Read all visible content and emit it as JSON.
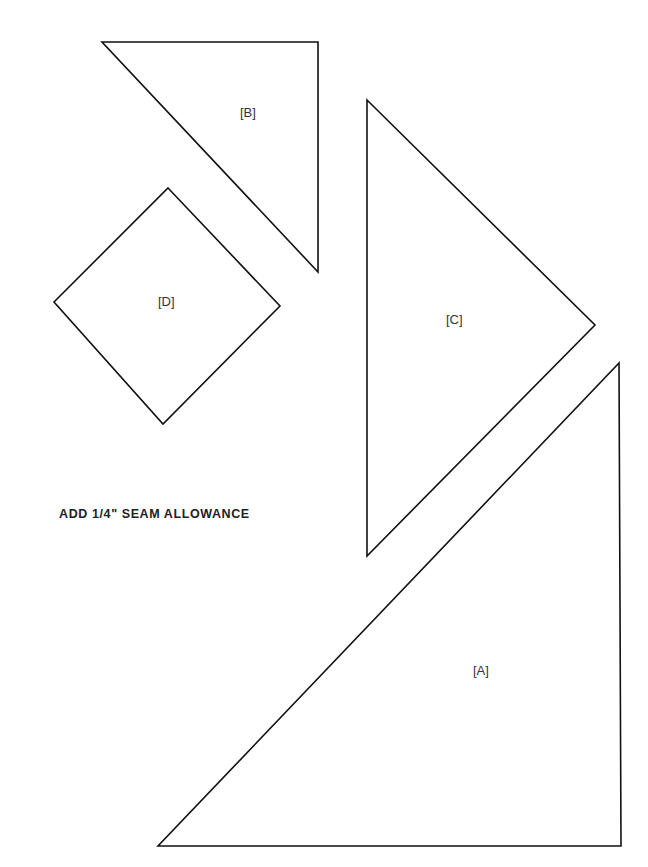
{
  "pieces": [
    {
      "id": "A",
      "label": "[A]",
      "points": "158,846 621,846 619,363"
    },
    {
      "id": "B",
      "label": "[B]",
      "points": "102,42 318,42 318,272"
    },
    {
      "id": "C",
      "label": "[C]",
      "points": "367,100 595,325 367,556"
    },
    {
      "id": "D",
      "label": "[D]",
      "points": "168,188 280,306 163,424 54,302"
    }
  ],
  "note": "ADD 1/4\" SEAM ALLOWANCE",
  "colors": {
    "stroke": "#111111",
    "background": "#ffffff"
  }
}
